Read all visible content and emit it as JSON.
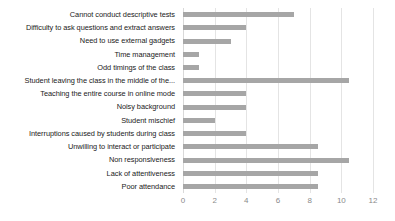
{
  "chart_data": {
    "type": "bar",
    "orientation": "horizontal",
    "title": "",
    "xlabel": "",
    "ylabel": "",
    "xlim": [
      0,
      12
    ],
    "xticks": [
      0,
      2,
      4,
      6,
      8,
      10,
      12
    ],
    "grid": true,
    "legend": false,
    "bar_color": "#a6a6a6",
    "gridline_color": "#e4e4e4",
    "tick_label_color": "#8a8a8a",
    "categories": [
      "Cannot conduct descriptive tests",
      "Difficulty to ask questions and extract answers",
      "Need to use external gadgets",
      "Time management",
      "Odd timings of the class",
      "Student leaving the class in the middle of the...",
      "Teaching the entire course in online mode",
      "Noisy background",
      "Student mischief",
      "Interruptions caused by students during class",
      "Unwilling to interact or participate",
      "Non responsiveness",
      "Lack of attentiveness",
      "Poor attendance"
    ],
    "values": [
      7,
      4,
      3,
      1,
      1,
      10.5,
      4,
      4,
      2,
      4,
      8.5,
      10.5,
      8.5,
      8.5
    ]
  }
}
